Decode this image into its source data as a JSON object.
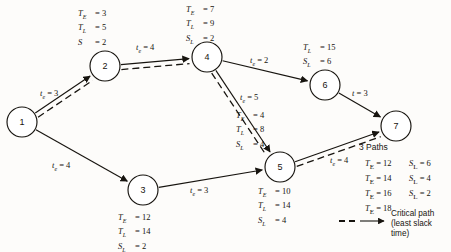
{
  "chart_data": {
    "type": "diagram",
    "nodes": [
      {
        "id": "1",
        "label": "1",
        "x": 22,
        "y": 122,
        "r": 15,
        "stats": []
      },
      {
        "id": "2",
        "label": "2",
        "x": 105,
        "y": 66,
        "r": 15,
        "stats": [
          {
            "key": "T_E",
            "value": "3"
          },
          {
            "key": "T_L",
            "value": "5"
          },
          {
            "key": "S",
            "value": "2"
          }
        ],
        "stat_x": 78,
        "stat_y": 8
      },
      {
        "id": "3",
        "label": "3",
        "x": 143,
        "y": 190,
        "r": 15,
        "stats": [
          {
            "key": "T_E",
            "value": "12"
          },
          {
            "key": "T_L",
            "value": "14"
          },
          {
            "key": "S_L",
            "value": "2"
          }
        ],
        "stat_x": 118,
        "stat_y": 212
      },
      {
        "id": "4",
        "label": "4",
        "x": 207,
        "y": 57,
        "r": 15,
        "stats": [
          {
            "key": "T_E",
            "value": "7"
          },
          {
            "key": "T_L",
            "value": "9"
          },
          {
            "key": "S_L",
            "value": "2"
          }
        ],
        "stat_x": 186,
        "stat_y": 4
      },
      {
        "id": "5",
        "label": "5",
        "x": 280,
        "y": 167,
        "r": 15,
        "stats": [
          {
            "key": "T_E",
            "value": "10"
          },
          {
            "key": "T_L",
            "value": "14"
          },
          {
            "key": "S_L",
            "value": "4"
          }
        ],
        "stat_x": 258,
        "stat_y": 186
      },
      {
        "id": "6",
        "label": "6",
        "x": 325,
        "y": 85,
        "r": 15,
        "stats": [
          {
            "key": "T_L",
            "value": "15"
          },
          {
            "key": "S_L",
            "value": "6"
          }
        ],
        "stat_x": 303,
        "stat_y": 42
      },
      {
        "id": "7",
        "label": "7",
        "x": 396,
        "y": 126,
        "r": 15,
        "stats": []
      }
    ],
    "node5_upper_stats": {
      "stats": [
        {
          "key": "T_E",
          "value": "4"
        },
        {
          "key": "T_L",
          "value": "8"
        },
        {
          "key": "S_L",
          "value": "4"
        }
      ],
      "x": 236,
      "y": 110
    },
    "edges": [
      {
        "from": "1",
        "to": "2",
        "te": "3",
        "label": "t_e = 3",
        "critical": true,
        "lx": 40,
        "ly": 88
      },
      {
        "from": "1",
        "to": "3",
        "te": "4",
        "label": "t_e = 4",
        "critical": false,
        "lx": 52,
        "ly": 160
      },
      {
        "from": "2",
        "to": "4",
        "te": "4",
        "label": "t_e = 4",
        "critical": true,
        "lx": 136,
        "ly": 42
      },
      {
        "from": "4",
        "to": "6",
        "te": "2",
        "label": "t_e = 2",
        "critical": false,
        "lx": 250,
        "ly": 55
      },
      {
        "from": "4",
        "to": "5",
        "te": "5",
        "label": "t_e = 5",
        "critical": true,
        "lx": 240,
        "ly": 92
      },
      {
        "from": "3",
        "to": "5",
        "te": "3",
        "label": "t_e = 3",
        "critical": false,
        "lx": 190,
        "ly": 185
      },
      {
        "from": "5",
        "to": "7",
        "te": "4",
        "label": "t_e = 4",
        "critical": true,
        "lx": 330,
        "ly": 155
      },
      {
        "from": "6",
        "to": "7",
        "te": "3",
        "label": "t = 3",
        "critical": false,
        "lx": 352,
        "ly": 88
      }
    ],
    "paths_title": "3 Paths",
    "paths_table": [
      {
        "te_key": "T_E",
        "te_value": "12",
        "sl_key": "S_L",
        "sl_value": "6"
      },
      {
        "te_key": "T_E",
        "te_value": "14",
        "sl_key": "S_L",
        "sl_value": "4"
      },
      {
        "te_key": "T_E",
        "te_value": "16",
        "sl_key": "S_L",
        "sl_value": "2"
      },
      {
        "te_key": "T_E",
        "te_value": "18",
        "sl_key": "",
        "sl_value": ""
      }
    ],
    "legend": {
      "line1": "Critical path",
      "line2": "(least slack",
      "line3": "time)"
    },
    "colors": {
      "ink": "#17140f",
      "paper": "#fdfcfa",
      "node_fill": "#ffffff"
    }
  }
}
